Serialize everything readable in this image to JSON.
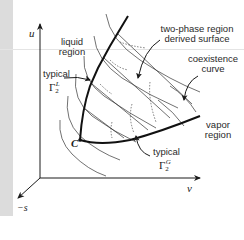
{
  "figure": {
    "axes": {
      "u_label": "u",
      "v_label": "v",
      "s_label": "−s"
    },
    "labels": {
      "liquid_region_line1": "liquid",
      "liquid_region_line2": "region",
      "two_phase_line1": "two-phase region",
      "two_phase_line2": "derived surface",
      "coexistence_line1": "coexistence",
      "coexistence_line2": "curve",
      "vapor_region_line1": "vapor",
      "vapor_region_line2": "region",
      "typical_L": "typical",
      "gamma_L_base": "Γ",
      "gamma_L_sub": "2",
      "gamma_L_sup": "L",
      "typical_G": "typical",
      "gamma_G_base": "Γ",
      "gamma_G_sub": "2",
      "gamma_G_sup": "G",
      "critical_point": "C"
    },
    "colors": {
      "ink": "#1a1a1a",
      "strip": "#dcdcdc",
      "background": "#ffffff"
    }
  }
}
